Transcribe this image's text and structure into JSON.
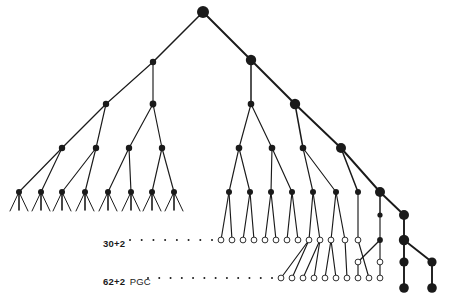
{
  "figure": {
    "type": "lineage-tree-diagram",
    "background_color": "#ffffff",
    "node_color": "#1a1a1a",
    "open_node_fill": "#ffffff",
    "edge_color": "#1a1a1a"
  },
  "annotations": {
    "row_30": {
      "bold_text": "30+2",
      "regular_text": "",
      "full_text": "30+2"
    },
    "row_62": {
      "bold_text": "62+2",
      "regular_text": "PGC",
      "full_text": "62+2 PGC"
    }
  },
  "chart_data": {
    "type": "tree",
    "title": "",
    "xlabel": "",
    "ylabel": "",
    "node_styles": {
      "filled": "solid dark disc",
      "open": "white disc with dark outline"
    },
    "size_classes": {
      "tiny": 2.1,
      "small": 2.9,
      "medium": 4.0,
      "large": 5.2,
      "xlarge": 6.0
    },
    "nodes": [
      {
        "id": "root",
        "x": 203,
        "y": 12,
        "r": 6.0,
        "style": "filled"
      },
      {
        "id": "L1",
        "x": 153,
        "y": 62,
        "r": 3.2,
        "style": "filled"
      },
      {
        "id": "L2a",
        "x": 106,
        "y": 104,
        "r": 3.2,
        "style": "filled"
      },
      {
        "id": "L2b",
        "x": 153,
        "y": 104,
        "r": 3.4,
        "style": "filled"
      },
      {
        "id": "L3a",
        "x": 62,
        "y": 148,
        "r": 3.2,
        "style": "filled"
      },
      {
        "id": "L3b",
        "x": 96,
        "y": 148,
        "r": 3.2,
        "style": "filled"
      },
      {
        "id": "L3c",
        "x": 129,
        "y": 148,
        "r": 3.2,
        "style": "filled"
      },
      {
        "id": "L3d",
        "x": 162,
        "y": 148,
        "r": 3.2,
        "style": "filled"
      },
      {
        "id": "T1",
        "x": 19,
        "y": 192,
        "r": 3.0,
        "style": "filled"
      },
      {
        "id": "T2",
        "x": 41,
        "y": 192,
        "r": 3.0,
        "style": "filled"
      },
      {
        "id": "T3",
        "x": 62,
        "y": 192,
        "r": 3.0,
        "style": "filled"
      },
      {
        "id": "T4",
        "x": 85,
        "y": 192,
        "r": 3.0,
        "style": "filled"
      },
      {
        "id": "T5",
        "x": 108,
        "y": 192,
        "r": 3.0,
        "style": "filled"
      },
      {
        "id": "T6",
        "x": 131,
        "y": 192,
        "r": 3.0,
        "style": "filled"
      },
      {
        "id": "T7",
        "x": 152,
        "y": 192,
        "r": 3.0,
        "style": "filled"
      },
      {
        "id": "T8",
        "x": 174,
        "y": 192,
        "r": 3.0,
        "style": "filled"
      },
      {
        "id": "R1",
        "x": 251,
        "y": 60,
        "r": 5.2,
        "style": "filled"
      },
      {
        "id": "R2",
        "x": 251,
        "y": 104,
        "r": 3.3,
        "style": "filled"
      },
      {
        "id": "R3",
        "x": 295,
        "y": 104,
        "r": 5.2,
        "style": "filled"
      },
      {
        "id": "R4",
        "x": 239,
        "y": 148,
        "r": 3.3,
        "style": "filled"
      },
      {
        "id": "R5",
        "x": 272,
        "y": 148,
        "r": 3.3,
        "style": "filled"
      },
      {
        "id": "R6",
        "x": 303,
        "y": 148,
        "r": 3.3,
        "style": "filled"
      },
      {
        "id": "R7",
        "x": 341,
        "y": 148,
        "r": 5.0,
        "style": "filled"
      },
      {
        "id": "M1",
        "x": 229,
        "y": 192,
        "r": 3.0,
        "style": "filled"
      },
      {
        "id": "M2",
        "x": 250,
        "y": 192,
        "r": 3.0,
        "style": "filled"
      },
      {
        "id": "M3",
        "x": 271,
        "y": 192,
        "r": 3.0,
        "style": "filled"
      },
      {
        "id": "M4",
        "x": 292,
        "y": 192,
        "r": 3.0,
        "style": "filled"
      },
      {
        "id": "M5",
        "x": 313,
        "y": 192,
        "r": 3.0,
        "style": "filled"
      },
      {
        "id": "M6",
        "x": 336,
        "y": 192,
        "r": 3.0,
        "style": "filled"
      },
      {
        "id": "M7",
        "x": 358,
        "y": 192,
        "r": 3.0,
        "style": "filled"
      },
      {
        "id": "M8",
        "x": 380,
        "y": 192,
        "r": 5.0,
        "style": "filled"
      },
      {
        "id": "F1",
        "x": 380,
        "y": 215,
        "r": 2.6,
        "style": "filled"
      },
      {
        "id": "F2",
        "x": 404,
        "y": 215,
        "r": 5.0,
        "style": "filled"
      },
      {
        "id": "F3",
        "x": 380,
        "y": 240,
        "r": 2.9,
        "style": "filled"
      },
      {
        "id": "F4",
        "x": 404,
        "y": 240,
        "r": 5.2,
        "style": "filled"
      },
      {
        "id": "F5",
        "x": 404,
        "y": 262,
        "r": 4.6,
        "style": "filled"
      },
      {
        "id": "F6",
        "x": 432,
        "y": 262,
        "r": 4.6,
        "style": "filled"
      },
      {
        "id": "F7",
        "x": 404,
        "y": 288,
        "r": 4.8,
        "style": "filled"
      },
      {
        "id": "F8",
        "x": 432,
        "y": 288,
        "r": 4.8,
        "style": "filled"
      },
      {
        "id": "O1",
        "x": 221,
        "y": 240,
        "r": 2.9,
        "style": "open"
      },
      {
        "id": "O2",
        "x": 232,
        "y": 240,
        "r": 2.9,
        "style": "open"
      },
      {
        "id": "O3",
        "x": 243,
        "y": 240,
        "r": 2.9,
        "style": "open"
      },
      {
        "id": "O4",
        "x": 254,
        "y": 240,
        "r": 2.9,
        "style": "open"
      },
      {
        "id": "O5",
        "x": 265,
        "y": 240,
        "r": 2.9,
        "style": "open"
      },
      {
        "id": "O6",
        "x": 276,
        "y": 240,
        "r": 2.9,
        "style": "open"
      },
      {
        "id": "O7",
        "x": 287,
        "y": 240,
        "r": 2.9,
        "style": "open"
      },
      {
        "id": "O8",
        "x": 298,
        "y": 240,
        "r": 2.9,
        "style": "open"
      },
      {
        "id": "O9",
        "x": 309,
        "y": 240,
        "r": 2.9,
        "style": "open"
      },
      {
        "id": "O10",
        "x": 320,
        "y": 240,
        "r": 2.9,
        "style": "open"
      },
      {
        "id": "O11",
        "x": 331,
        "y": 240,
        "r": 2.9,
        "style": "open"
      },
      {
        "id": "O12",
        "x": 345,
        "y": 240,
        "r": 2.9,
        "style": "open"
      },
      {
        "id": "O13",
        "x": 358,
        "y": 240,
        "r": 2.9,
        "style": "open"
      },
      {
        "id": "P1",
        "x": 281,
        "y": 278,
        "r": 2.9,
        "style": "open"
      },
      {
        "id": "P2",
        "x": 292,
        "y": 278,
        "r": 2.9,
        "style": "open"
      },
      {
        "id": "P3",
        "x": 303,
        "y": 278,
        "r": 2.9,
        "style": "open"
      },
      {
        "id": "P4",
        "x": 314,
        "y": 278,
        "r": 2.9,
        "style": "open"
      },
      {
        "id": "P5",
        "x": 325,
        "y": 278,
        "r": 2.9,
        "style": "open"
      },
      {
        "id": "P6",
        "x": 336,
        "y": 278,
        "r": 2.9,
        "style": "open"
      },
      {
        "id": "P7",
        "x": 347,
        "y": 278,
        "r": 2.9,
        "style": "open"
      },
      {
        "id": "P8",
        "x": 358,
        "y": 278,
        "r": 2.9,
        "style": "open"
      },
      {
        "id": "P9",
        "x": 369,
        "y": 278,
        "r": 2.9,
        "style": "open"
      },
      {
        "id": "P10",
        "x": 380,
        "y": 278,
        "r": 2.9,
        "style": "open"
      },
      {
        "id": "Q1",
        "x": 358,
        "y": 262,
        "r": 2.9,
        "style": "open"
      },
      {
        "id": "Q2",
        "x": 380,
        "y": 262,
        "r": 2.9,
        "style": "open"
      }
    ],
    "edges": [
      [
        "root",
        "L1"
      ],
      [
        "root",
        "R1"
      ],
      [
        "L1",
        "L2a"
      ],
      [
        "L1",
        "L2b"
      ],
      [
        "L2a",
        "L3a"
      ],
      [
        "L2a",
        "L3b"
      ],
      [
        "L2b",
        "L3c"
      ],
      [
        "L2b",
        "L3d"
      ],
      [
        "L3a",
        "T1"
      ],
      [
        "L3a",
        "T2"
      ],
      [
        "L3b",
        "T3"
      ],
      [
        "L3b",
        "T4"
      ],
      [
        "L3c",
        "T5"
      ],
      [
        "L3c",
        "T6"
      ],
      [
        "L3d",
        "T7"
      ],
      [
        "L3d",
        "T8"
      ],
      [
        "R1",
        "R2"
      ],
      [
        "R1",
        "R3"
      ],
      [
        "R2",
        "R4"
      ],
      [
        "R2",
        "R5"
      ],
      [
        "R3",
        "R6"
      ],
      [
        "R3",
        "R7"
      ],
      [
        "R4",
        "M1"
      ],
      [
        "R4",
        "M2"
      ],
      [
        "R5",
        "M3"
      ],
      [
        "R5",
        "M4"
      ],
      [
        "R6",
        "M5"
      ],
      [
        "R6",
        "M6"
      ],
      [
        "R7",
        "M7"
      ],
      [
        "R7",
        "M8"
      ],
      [
        "M1",
        "O1"
      ],
      [
        "M1",
        "O2"
      ],
      [
        "M2",
        "O3"
      ],
      [
        "M2",
        "O4"
      ],
      [
        "M3",
        "O5"
      ],
      [
        "M3",
        "O6"
      ],
      [
        "M4",
        "O7"
      ],
      [
        "M4",
        "O8"
      ],
      [
        "M5",
        "O9"
      ],
      [
        "M5",
        "O10"
      ],
      [
        "M6",
        "O11"
      ],
      [
        "M6",
        "O12"
      ],
      [
        "M7",
        "O13"
      ],
      [
        "M8",
        "F1"
      ],
      [
        "M8",
        "F2"
      ],
      [
        "F1",
        "F3"
      ],
      [
        "F2",
        "F4"
      ],
      [
        "F3",
        "Q1"
      ],
      [
        "F3",
        "Q2"
      ],
      [
        "Q1",
        "P8"
      ],
      [
        "Q2",
        "P10"
      ],
      [
        "F4",
        "F5"
      ],
      [
        "F4",
        "F6"
      ],
      [
        "F5",
        "F7"
      ],
      [
        "F6",
        "F8"
      ],
      [
        "O9",
        "P1"
      ],
      [
        "O9",
        "P2"
      ],
      [
        "O10",
        "P3"
      ],
      [
        "O10",
        "P4"
      ],
      [
        "O11",
        "P5"
      ],
      [
        "O11",
        "P6"
      ],
      [
        "O12",
        "P7"
      ],
      [
        "O13",
        "P9"
      ]
    ],
    "terminal_stubs": [
      {
        "from": [
          19,
          192
        ],
        "to": [
          19,
          210
        ]
      },
      {
        "from": [
          41,
          192
        ],
        "to": [
          41,
          210
        ]
      },
      {
        "from": [
          62,
          192
        ],
        "to": [
          62,
          210
        ]
      },
      {
        "from": [
          85,
          192
        ],
        "to": [
          85,
          210
        ]
      },
      {
        "from": [
          108,
          192
        ],
        "to": [
          108,
          210
        ]
      },
      {
        "from": [
          131,
          192
        ],
        "to": [
          131,
          210
        ]
      },
      {
        "from": [
          152,
          192
        ],
        "to": [
          152,
          210
        ]
      },
      {
        "from": [
          174,
          192
        ],
        "to": [
          174,
          210
        ]
      }
    ],
    "dot_rows": [
      {
        "label_key": "row_30",
        "y": 240,
        "x_start": 130,
        "x_end": 212,
        "count": 8
      },
      {
        "label_key": "row_62",
        "y": 278,
        "x_start": 148,
        "x_end": 272,
        "count": 12
      }
    ]
  }
}
